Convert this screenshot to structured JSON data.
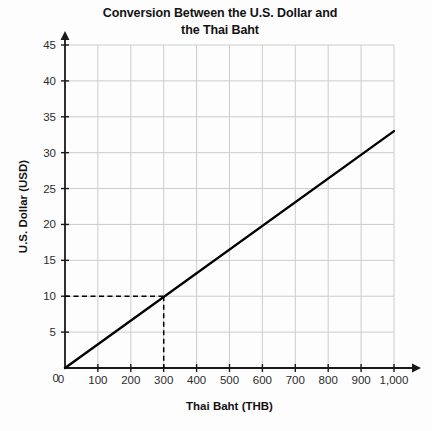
{
  "chart_data": {
    "type": "line",
    "title": "Conversion Between the U.S. Dollar and the Thai Baht",
    "title_line1": "Conversion Between the U.S. Dollar and",
    "title_line2": "the Thai Baht",
    "xlabel": "Thai Baht (THB)",
    "ylabel": "U.S. Dollar (USD)",
    "xlim": [
      0,
      1000
    ],
    "ylim": [
      0,
      45
    ],
    "xticks": [
      0,
      100,
      200,
      300,
      400,
      500,
      600,
      700,
      800,
      900,
      1000
    ],
    "xtick_labels": [
      "0",
      "100",
      "200",
      "300",
      "400",
      "500",
      "600",
      "700",
      "800",
      "900",
      "1,000"
    ],
    "yticks": [
      0,
      5,
      10,
      15,
      20,
      25,
      30,
      35,
      40,
      45
    ],
    "ytick_labels": [
      "0",
      "5",
      "10",
      "15",
      "20",
      "25",
      "30",
      "35",
      "40",
      "45"
    ],
    "grid": true,
    "legend": false,
    "series": [
      {
        "name": "USD per THB conversion",
        "points": [
          [
            0,
            0
          ],
          [
            1000,
            33
          ]
        ],
        "slope": 0.033,
        "color": "#000000"
      }
    ],
    "annotations": [
      {
        "kind": "dashed-reference-lines",
        "point": [
          300,
          10
        ],
        "x_value": 300,
        "y_value": 10,
        "color": "#000000"
      }
    ],
    "colors": {
      "line": "#000000",
      "grid": "#cccccc",
      "axis": "#1a1a1a",
      "background": "#fdfdfd",
      "text": "#131313"
    }
  }
}
